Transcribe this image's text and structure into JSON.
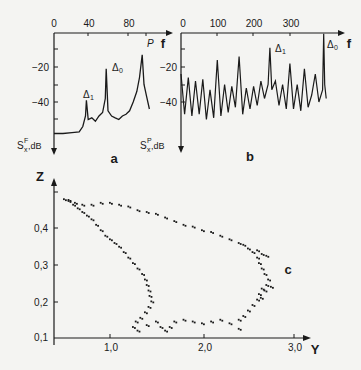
{
  "chart_data": [
    {
      "panel": "a",
      "type": "line",
      "title": "",
      "xlabel": "f",
      "ylabel_left": "S^F_x, dB",
      "ylabel_right": "S^P_x, dB",
      "x_ticks": [
        "0",
        "40",
        "80"
      ],
      "y_ticks": [
        "-20",
        "-40"
      ],
      "y_ticks_right": [
        "-20",
        "-40"
      ],
      "xlim": [
        0,
        100
      ],
      "ylim": [
        0,
        -60
      ],
      "annotations": [
        {
          "label": "Δ1",
          "x": 36,
          "y": -39
        },
        {
          "label": "Δ0",
          "x": 58,
          "y": -21
        },
        {
          "label": "P",
          "x": 98,
          "y": -13
        }
      ],
      "x": [
        0,
        10,
        20,
        28,
        32,
        35,
        36,
        38,
        42,
        46,
        50,
        54,
        57,
        58,
        60,
        64,
        68,
        72,
        76,
        80,
        84,
        88,
        92,
        95,
        98,
        100,
        103,
        106
      ],
      "values": [
        -58,
        -58,
        -57.5,
        -57,
        -54,
        -48,
        -39,
        -50,
        -49,
        -51,
        -48,
        -46,
        -38,
        -21,
        -45,
        -48,
        -49,
        -50,
        -48,
        -47,
        -45,
        -40,
        -34,
        -26,
        -13,
        -30,
        -37,
        -44
      ]
    },
    {
      "panel": "b",
      "type": "line",
      "xlabel": "f",
      "x_ticks": [
        "0",
        "100",
        "200",
        "300"
      ],
      "y_ticks": [
        "-20",
        "-40"
      ],
      "xlim": [
        0,
        400
      ],
      "ylim": [
        0,
        -60
      ],
      "annotations": [
        {
          "label": "Δ1",
          "x": 245,
          "y": -9
        },
        {
          "label": "Δ0",
          "x": 393,
          "y": -1
        }
      ],
      "x": [
        0,
        10,
        20,
        30,
        40,
        50,
        60,
        70,
        80,
        90,
        100,
        110,
        120,
        130,
        140,
        150,
        160,
        170,
        180,
        190,
        200,
        210,
        220,
        230,
        240,
        245,
        250,
        260,
        270,
        280,
        290,
        300,
        310,
        320,
        330,
        340,
        350,
        360,
        370,
        380,
        390,
        393,
        396,
        400
      ],
      "values": [
        -24,
        -47,
        -26,
        -48,
        -28,
        -47,
        -27,
        -50,
        -33,
        -49,
        -16,
        -48,
        -30,
        -46,
        -31,
        -43,
        -14,
        -47,
        -32,
        -44,
        -31,
        -42,
        -28,
        -38,
        -30,
        -9,
        -33,
        -28,
        -42,
        -30,
        -44,
        -18,
        -44,
        -30,
        -45,
        -21,
        -43,
        -36,
        -24,
        -40,
        -33,
        -1,
        -30,
        -38
      ]
    },
    {
      "panel": "c",
      "type": "scatter",
      "xlabel": "Y",
      "ylabel": "Z",
      "x_ticks": [
        "1,0",
        "2,0",
        "3,0"
      ],
      "y_ticks": [
        "0,1",
        "0,2",
        "0,3",
        "0,4"
      ],
      "xlim": [
        0.4,
        3.2
      ],
      "ylim": [
        0.1,
        0.5
      ],
      "series": [
        {
          "name": "trajectory",
          "points": [
            [
              0.5,
              0.48
            ],
            [
              0.55,
              0.475
            ],
            [
              0.6,
              0.465
            ],
            [
              0.65,
              0.455
            ],
            [
              0.7,
              0.445
            ],
            [
              0.75,
              0.435
            ],
            [
              0.8,
              0.425
            ],
            [
              0.85,
              0.41
            ],
            [
              0.9,
              0.395
            ],
            [
              0.95,
              0.38
            ],
            [
              1.0,
              0.37
            ],
            [
              1.05,
              0.36
            ],
            [
              1.1,
              0.35
            ],
            [
              1.15,
              0.335
            ],
            [
              1.2,
              0.32
            ],
            [
              1.25,
              0.305
            ],
            [
              1.3,
              0.29
            ],
            [
              1.35,
              0.275
            ],
            [
              1.38,
              0.26
            ],
            [
              1.4,
              0.245
            ],
            [
              1.42,
              0.23
            ],
            [
              1.43,
              0.215
            ],
            [
              1.45,
              0.2
            ],
            [
              1.42,
              0.185
            ],
            [
              1.38,
              0.17
            ],
            [
              1.33,
              0.155
            ],
            [
              1.28,
              0.145
            ],
            [
              1.25,
              0.13
            ],
            [
              1.3,
              0.12
            ],
            [
              1.4,
              0.135
            ],
            [
              1.5,
              0.145
            ],
            [
              1.55,
              0.13
            ],
            [
              1.6,
              0.12
            ],
            [
              1.65,
              0.13
            ],
            [
              1.7,
              0.145
            ],
            [
              1.8,
              0.15
            ],
            [
              1.9,
              0.145
            ],
            [
              2.0,
              0.14
            ],
            [
              2.1,
              0.145
            ],
            [
              2.2,
              0.15
            ],
            [
              2.3,
              0.14
            ],
            [
              2.4,
              0.15
            ],
            [
              2.45,
              0.16
            ],
            [
              2.5,
              0.175
            ],
            [
              2.55,
              0.19
            ],
            [
              2.6,
              0.205
            ],
            [
              2.62,
              0.22
            ],
            [
              2.65,
              0.235
            ],
            [
              2.7,
              0.245
            ],
            [
              2.72,
              0.26
            ],
            [
              2.68,
              0.275
            ],
            [
              2.65,
              0.29
            ],
            [
              2.62,
              0.305
            ],
            [
              2.6,
              0.32
            ],
            [
              2.55,
              0.335
            ],
            [
              2.5,
              0.345
            ],
            [
              2.45,
              0.355
            ],
            [
              2.4,
              0.36
            ],
            [
              2.3,
              0.37
            ],
            [
              2.2,
              0.38
            ],
            [
              2.1,
              0.39
            ],
            [
              2.0,
              0.395
            ],
            [
              1.9,
              0.405
            ],
            [
              1.8,
              0.41
            ],
            [
              1.7,
              0.42
            ],
            [
              1.6,
              0.43
            ],
            [
              1.5,
              0.44
            ],
            [
              1.4,
              0.445
            ],
            [
              1.3,
              0.45
            ],
            [
              1.2,
              0.46
            ],
            [
              1.1,
              0.465
            ],
            [
              1.0,
              0.47
            ],
            [
              0.9,
              0.47
            ],
            [
              0.8,
              0.465
            ],
            [
              0.7,
              0.465
            ],
            [
              0.62,
              0.47
            ],
            [
              0.55,
              0.478
            ],
            [
              2.7,
              0.325
            ],
            [
              2.65,
              0.33
            ],
            [
              2.6,
              0.34
            ],
            [
              2.75,
              0.24
            ],
            [
              2.68,
              0.23
            ],
            [
              2.64,
              0.21
            ],
            [
              2.4,
              0.125
            ]
          ]
        }
      ],
      "annotations": [
        {
          "label": "c"
        }
      ]
    }
  ],
  "labels": {
    "a": {
      "x_axis": "f",
      "y_left": "S",
      "y_left_sup": "F",
      "y_left_sub": "x",
      "y_left_unit": ",dB",
      "y_right": "S",
      "y_right_sup": "P",
      "y_right_sub": "x",
      "y_right_unit": ",dB",
      "panel": "a",
      "delta1": "Δ",
      "delta1_sub": "1",
      "delta0": "Δ",
      "delta0_sub": "0",
      "peak": "P",
      "x_ticks": [
        "0",
        "40",
        "80"
      ],
      "y_ticks": [
        "−20",
        "−40"
      ]
    },
    "b": {
      "x_axis": "f",
      "panel": "b",
      "delta1": "Δ",
      "delta1_sub": "1",
      "delta0": "Δ",
      "delta0_sub": "0",
      "x_ticks": [
        "0",
        "100",
        "200",
        "300"
      ],
      "y_ticks": [
        "−20",
        "−40"
      ]
    },
    "c": {
      "x_axis": "Y",
      "y_axis": "Z",
      "panel": "c",
      "x_ticks": [
        "1,0",
        "2,0",
        "3,0"
      ],
      "y_ticks": [
        "0,4",
        "0,3",
        "0,2",
        "0,1"
      ]
    }
  }
}
